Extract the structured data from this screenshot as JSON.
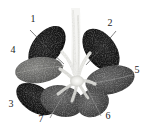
{
  "figure": {
    "caption": "stems",
    "background_color": "#ffffff",
    "width": 151,
    "height": 134,
    "color_mode": "grayscale"
  },
  "labels": [
    {
      "id": "1",
      "text": "1",
      "x": 32,
      "y": 18,
      "leaf": "upper-left"
    },
    {
      "id": "2",
      "text": "2",
      "x": 110,
      "y": 23,
      "leaf": "upper-right"
    },
    {
      "id": "3",
      "text": "3",
      "x": 11,
      "y": 104,
      "leaf": "lower-left"
    },
    {
      "id": "4",
      "text": "4",
      "x": 13,
      "y": 50,
      "leaf": "mid-left"
    },
    {
      "id": "5",
      "text": "5",
      "x": 137,
      "y": 70,
      "leaf": "mid-right"
    },
    {
      "id": "6",
      "text": "6",
      "x": 108,
      "y": 116,
      "leaf": "lower-right"
    },
    {
      "id": "7",
      "text": "7",
      "x": 41,
      "y": 119,
      "leaf": "bottom-center"
    }
  ],
  "colors": {
    "background": "#ffffff",
    "leaf_dark": "#151515",
    "leaf_mid": "#4a4a4a",
    "leaf_light": "#7d7d7d",
    "stem_light": "#ededea",
    "stem_shadow": "#b8b8b4",
    "label_text": "#1d1d1d",
    "caption_text": "#2b2b2b"
  },
  "leaves": [
    {
      "number": "1",
      "tone": "dark",
      "cx": 47,
      "cy": 47,
      "rx": 24,
      "ry": 14,
      "rot": -52
    },
    {
      "number": "2",
      "tone": "dark",
      "cx": 101,
      "cy": 50,
      "rx": 24,
      "ry": 15,
      "rot": 54
    },
    {
      "number": "3",
      "tone": "dark",
      "cx": 36,
      "cy": 98,
      "rx": 22,
      "ry": 13,
      "rot": 34
    },
    {
      "number": "4",
      "tone": "mid",
      "cx": 38,
      "cy": 70,
      "rx": 24,
      "ry": 13,
      "rot": -6
    },
    {
      "number": "5",
      "tone": "mid",
      "cx": 110,
      "cy": 80,
      "rx": 25,
      "ry": 14,
      "rot": -14
    },
    {
      "number": "6",
      "tone": "mid",
      "cx": 92,
      "cy": 103,
      "rx": 16,
      "ry": 13,
      "rot": -26
    },
    {
      "number": "7",
      "tone": "mid",
      "cx": 62,
      "cy": 101,
      "rx": 22,
      "ry": 15,
      "rot": 12
    }
  ]
}
